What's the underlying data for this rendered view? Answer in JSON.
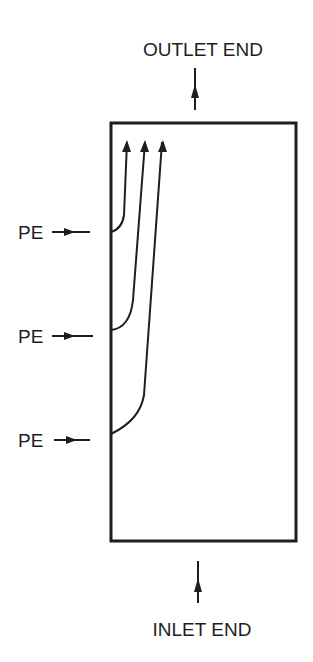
{
  "diagram": {
    "outlet_label": "OUTLET END",
    "inlet_label": "INLET END",
    "injection_points": [
      {
        "label": "PE",
        "y": 232
      },
      {
        "label": "PE",
        "y": 336
      },
      {
        "label": "PE",
        "y": 440
      }
    ],
    "colors": {
      "stroke": "#1e1e1e",
      "background": "#ffffff"
    }
  }
}
